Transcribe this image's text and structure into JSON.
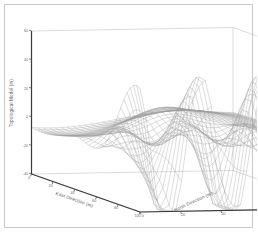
{
  "figure": {
    "background_color": "#ffffff",
    "border_color": "#c9c9c9",
    "line_color": "#9c9c9c",
    "axis_color": "#555555"
  },
  "chart_data": {
    "type": "surface",
    "render": "wireframe-3d",
    "title": "",
    "subtitle": "",
    "zlabel": "Topological Model (m)",
    "xlabel": "East Direction (m)",
    "ylabel": "North Direction (m)",
    "zlim": [
      -40,
      60
    ],
    "xlim": [
      0,
      100
    ],
    "ylim": [
      0,
      100
    ],
    "ztick_labels": [
      "60",
      "40",
      "20",
      "0",
      "-20",
      "-40"
    ],
    "ztick_values": [
      60,
      40,
      20,
      0,
      -20,
      -40
    ],
    "xtick_labels": [
      "0",
      "20",
      "40",
      "60",
      "80",
      "100"
    ],
    "xtick_values": [
      0,
      20,
      40,
      60,
      80,
      100
    ],
    "ytick_labels": [
      "0",
      "20",
      "40",
      "60",
      "80",
      "100"
    ],
    "ytick_values": [
      0,
      20,
      40,
      60,
      80,
      100
    ],
    "grid": true,
    "legend": "none",
    "mesh_rows": 34,
    "mesh_cols": 34,
    "surface_model": "damped_oscillatory_ridges",
    "peak_value": 55,
    "trough_value": -32,
    "view_elevation_deg": 22,
    "view_azimuth_deg": -52
  }
}
